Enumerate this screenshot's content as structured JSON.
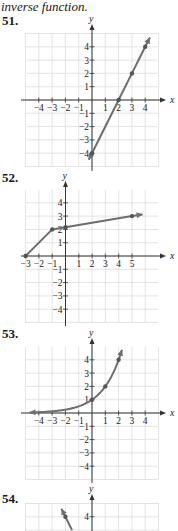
{
  "intro_text": "inverse function.",
  "problems": [
    {
      "number": "51.",
      "chart_data": {
        "type": "line",
        "title": "",
        "xlabel": "x",
        "ylabel": "y",
        "xlim": [
          -5,
          5
        ],
        "ylim": [
          -5,
          5
        ],
        "grid": true,
        "x_tick_labels": [
          "-4",
          "-3",
          "-2",
          "-1",
          "1",
          "2",
          "3",
          "4"
        ],
        "y_tick_labels": [
          "4",
          "3",
          "2",
          "1",
          "-1",
          "-2",
          "-3",
          "-4"
        ],
        "series": [
          {
            "name": "f",
            "points": [
              [
                -0.25,
                -4.5
              ],
              [
                0,
                -4
              ],
              [
                2,
                0
              ],
              [
                3,
                2
              ],
              [
                4,
                4
              ],
              [
                4.35,
                4.7
              ]
            ],
            "marked_points": [
              [
                0,
                -4
              ],
              [
                2,
                0
              ],
              [
                3,
                2
              ],
              [
                4,
                4
              ]
            ],
            "arrows": "both"
          }
        ]
      }
    },
    {
      "number": "52.",
      "chart_data": {
        "type": "line",
        "title": "",
        "xlabel": "x",
        "ylabel": "y",
        "xlim": [
          -4,
          6
        ],
        "ylim": [
          -5,
          5
        ],
        "grid": true,
        "x_tick_labels": [
          "-3",
          "-2",
          "-1",
          "1",
          "2",
          "3",
          "4",
          "5"
        ],
        "y_tick_labels": [
          "4",
          "3",
          "2",
          "1",
          "-1",
          "-2",
          "-3",
          "-4"
        ],
        "series": [
          {
            "name": "f",
            "points": [
              [
                -3,
                0
              ],
              [
                -1,
                2
              ],
              [
                5,
                3
              ],
              [
                5.8,
                3.13
              ]
            ],
            "marked_points": [
              [
                -3,
                0
              ],
              [
                -1,
                2
              ],
              [
                0,
                2.17
              ],
              [
                5,
                3
              ]
            ],
            "arrows": "right"
          }
        ]
      }
    },
    {
      "number": "53.",
      "chart_data": {
        "type": "line",
        "title": "",
        "xlabel": "x",
        "ylabel": "y",
        "xlim": [
          -5,
          5
        ],
        "ylim": [
          -5,
          5
        ],
        "grid": true,
        "x_tick_labels": [
          "-4",
          "-3",
          "-2",
          "-1",
          "1",
          "2",
          "3",
          "4"
        ],
        "y_tick_labels": [
          "4",
          "3",
          "2",
          "1",
          "-1",
          "-2",
          "-3",
          "-4"
        ],
        "series": [
          {
            "name": "f = 2^x",
            "points": [
              [
                -4.7,
                0.04
              ],
              [
                -4,
                0.06
              ],
              [
                -3,
                0.125
              ],
              [
                -2,
                0.25
              ],
              [
                -1,
                0.5
              ],
              [
                0,
                1
              ],
              [
                1,
                2
              ],
              [
                2,
                4
              ],
              [
                2.25,
                4.76
              ]
            ],
            "marked_points": [
              [
                0,
                1
              ],
              [
                1,
                2
              ],
              [
                2,
                4
              ]
            ],
            "arrows": "both"
          }
        ]
      }
    },
    {
      "number": "54.",
      "chart_data": {
        "type": "line",
        "title": "",
        "xlabel": "x",
        "ylabel": "y",
        "xlim": [
          -5,
          5
        ],
        "ylim": [
          -5,
          5
        ],
        "grid": true,
        "y_tick_labels": [
          "4"
        ],
        "series": [
          {
            "name": "f",
            "points": [
              [
                -2.3,
                4.6
              ],
              [
                -2,
                4
              ],
              [
                -1.5,
                3
              ]
            ],
            "marked_points": [
              [
                -2,
                4
              ]
            ],
            "arrows": "left"
          }
        ]
      }
    }
  ]
}
